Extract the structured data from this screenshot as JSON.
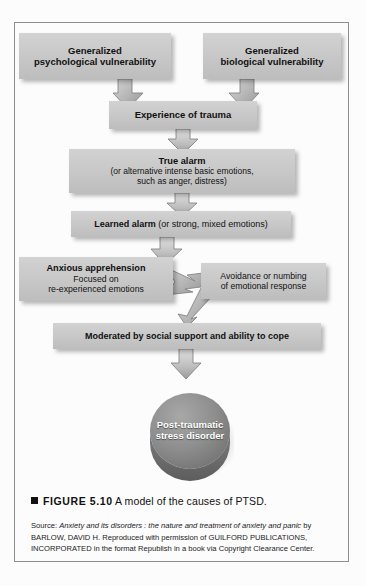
{
  "figure": {
    "boxes": {
      "psych_vulnerability_line1": "Generalized",
      "psych_vulnerability_line2": "psychological vulnerability",
      "bio_vulnerability_line1": "Generalized",
      "bio_vulnerability_line2": "biological vulnerability",
      "experience_of_trauma": "Experience of trauma",
      "true_alarm_title": "True alarm",
      "true_alarm_sub_line1": "(or alternative intense basic emotions,",
      "true_alarm_sub_line2": "such as anger, distress)",
      "learned_alarm_title": "Learned alarm",
      "learned_alarm_sub": " (or strong, mixed emotions)",
      "anxious_apprehension_title": "Anxious apprehension",
      "anxious_apprehension_line2": "Focused on",
      "anxious_apprehension_line3": "re-experienced emotions",
      "avoidance_line1": "Avoidance or numbing",
      "avoidance_line2": "of emotional response",
      "moderated": "Moderated by social support and ability to cope",
      "ptsd_line1": "Post-traumatic",
      "ptsd_line2": "stress disorder"
    },
    "caption": {
      "figure_label": "FIGURE 5.10",
      "caption_text": " A model of the causes of PTSD."
    },
    "source": {
      "prefix": "Source: ",
      "title_italic": "Anxiety and its disorders : the nature and treatment of anxiety and panic",
      "rest": " by BARLOW, DAVID H. Reproduced with permission of GUILFORD PUBLICATIONS, INCORPORATED in the format Republish in a book via Copyright Clearance Center."
    },
    "colors": {
      "box_fill": "#c9c9c9",
      "box_shadow": "rgba(0,0,0,0.28)",
      "arrow_fill": "#b3b3b3",
      "arrow_stroke": "#6f6f6f",
      "disc_top": "#8f8f8f",
      "disc_side": "#6e6e6e",
      "frame_border": "#8d8d8d",
      "page_background": "#fcfcfc",
      "text": "#111111",
      "disc_text": "#ffffff"
    }
  }
}
